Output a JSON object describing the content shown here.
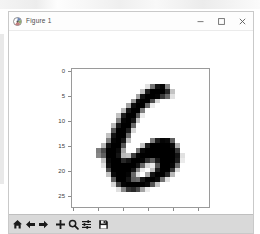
{
  "window": {
    "title": "Figure 1",
    "icon": "matplotlib-logo-icon",
    "controls": {
      "minimize": "minimize-button",
      "maximize": "maximize-button",
      "close": "close-button"
    }
  },
  "toolbar": {
    "buttons": [
      {
        "name": "home-button",
        "icon": "home-icon",
        "tooltip": "Reset original view"
      },
      {
        "name": "back-button",
        "icon": "arrow-left-icon",
        "tooltip": "Back to previous view"
      },
      {
        "name": "forward-button",
        "icon": "arrow-right-icon",
        "tooltip": "Forward to next view"
      },
      {
        "name": "pan-button",
        "icon": "move-cross-icon",
        "tooltip": "Pan axes with left mouse, zoom with right"
      },
      {
        "name": "zoom-button",
        "icon": "magnifier-icon",
        "tooltip": "Zoom to rectangle"
      },
      {
        "name": "subplots-button",
        "icon": "sliders-icon",
        "tooltip": "Configure subplots"
      },
      {
        "name": "save-button",
        "icon": "floppy-disk-icon",
        "tooltip": "Save the figure"
      }
    ]
  },
  "chart_data": {
    "type": "heatmap",
    "title": "",
    "xlabel": "",
    "ylabel": "",
    "colormap": "gray_r",
    "grid": false,
    "legend": "none",
    "xlim": [
      -0.5,
      27.5
    ],
    "ylim": [
      27.5,
      -0.5
    ],
    "xticks": [
      0,
      5,
      10,
      15,
      20,
      25
    ],
    "yticks": [
      0,
      5,
      10,
      15,
      20,
      25
    ],
    "xticklabels": [
      "0",
      "5",
      "10",
      "15",
      "20",
      "25"
    ],
    "yticklabels": [
      "0",
      "5",
      "10",
      "15",
      "20",
      "25"
    ],
    "shape": [
      28,
      28
    ],
    "vmin": 0,
    "vmax": 255,
    "values": [
      [
        0,
        0,
        0,
        0,
        0,
        0,
        0,
        0,
        0,
        0,
        0,
        0,
        0,
        0,
        0,
        0,
        0,
        0,
        0,
        0,
        0,
        0,
        0,
        0,
        0,
        0,
        0,
        0
      ],
      [
        0,
        0,
        0,
        0,
        0,
        0,
        0,
        0,
        0,
        0,
        0,
        0,
        0,
        0,
        0,
        0,
        0,
        0,
        0,
        0,
        0,
        0,
        0,
        0,
        0,
        0,
        0,
        0
      ],
      [
        0,
        0,
        0,
        0,
        0,
        0,
        0,
        0,
        0,
        0,
        0,
        0,
        0,
        0,
        0,
        0,
        0,
        0,
        0,
        0,
        0,
        0,
        0,
        0,
        0,
        0,
        0,
        0
      ],
      [
        0,
        0,
        0,
        0,
        0,
        0,
        0,
        0,
        0,
        0,
        0,
        0,
        0,
        0,
        0,
        30,
        140,
        235,
        250,
        120,
        0,
        0,
        0,
        0,
        0,
        0,
        0,
        0
      ],
      [
        0,
        0,
        0,
        0,
        0,
        0,
        0,
        0,
        0,
        0,
        0,
        0,
        0,
        0,
        60,
        225,
        255,
        255,
        255,
        215,
        60,
        0,
        0,
        0,
        0,
        0,
        0,
        0
      ],
      [
        0,
        0,
        0,
        0,
        0,
        0,
        0,
        0,
        0,
        0,
        0,
        0,
        0,
        90,
        235,
        255,
        255,
        250,
        200,
        150,
        30,
        0,
        0,
        0,
        0,
        0,
        0,
        0
      ],
      [
        0,
        0,
        0,
        0,
        0,
        0,
        0,
        0,
        0,
        0,
        0,
        0,
        105,
        245,
        255,
        255,
        180,
        40,
        0,
        0,
        0,
        0,
        0,
        0,
        0,
        0,
        0,
        0
      ],
      [
        0,
        0,
        0,
        0,
        0,
        0,
        0,
        0,
        0,
        0,
        0,
        90,
        240,
        255,
        255,
        150,
        20,
        0,
        0,
        0,
        0,
        0,
        0,
        0,
        0,
        0,
        0,
        0
      ],
      [
        0,
        0,
        0,
        0,
        0,
        0,
        0,
        0,
        0,
        0,
        70,
        235,
        255,
        255,
        130,
        0,
        0,
        0,
        0,
        0,
        0,
        0,
        0,
        0,
        0,
        0,
        0,
        0
      ],
      [
        0,
        0,
        0,
        0,
        0,
        0,
        0,
        0,
        0,
        60,
        225,
        255,
        255,
        170,
        20,
        0,
        0,
        0,
        0,
        0,
        0,
        0,
        0,
        0,
        0,
        0,
        0,
        0
      ],
      [
        0,
        0,
        0,
        0,
        0,
        0,
        0,
        0,
        0,
        130,
        250,
        255,
        235,
        60,
        0,
        0,
        0,
        0,
        0,
        0,
        0,
        0,
        0,
        0,
        0,
        0,
        0,
        0
      ],
      [
        0,
        0,
        0,
        0,
        0,
        0,
        0,
        0,
        70,
        230,
        255,
        255,
        150,
        0,
        0,
        0,
        0,
        0,
        0,
        0,
        0,
        0,
        0,
        0,
        0,
        0,
        0,
        0
      ],
      [
        0,
        0,
        0,
        0,
        0,
        0,
        0,
        0,
        170,
        255,
        255,
        225,
        40,
        0,
        0,
        0,
        0,
        0,
        0,
        0,
        0,
        0,
        0,
        0,
        0,
        0,
        0,
        0
      ],
      [
        0,
        0,
        0,
        0,
        0,
        0,
        0,
        60,
        235,
        255,
        255,
        150,
        0,
        0,
        0,
        0,
        0,
        0,
        0,
        0,
        0,
        0,
        0,
        0,
        0,
        0,
        0,
        0
      ],
      [
        0,
        0,
        0,
        0,
        0,
        0,
        0,
        130,
        250,
        255,
        235,
        60,
        0,
        0,
        0,
        0,
        130,
        225,
        250,
        245,
        160,
        0,
        0,
        0,
        0,
        0,
        0,
        0
      ],
      [
        0,
        0,
        0,
        0,
        0,
        0,
        70,
        235,
        255,
        255,
        170,
        0,
        0,
        0,
        60,
        225,
        255,
        255,
        255,
        255,
        245,
        80,
        0,
        0,
        0,
        0,
        0,
        0
      ],
      [
        0,
        0,
        0,
        0,
        0,
        130,
        180,
        255,
        255,
        245,
        90,
        0,
        0,
        140,
        245,
        255,
        255,
        255,
        255,
        255,
        255,
        200,
        0,
        0,
        0,
        0,
        0,
        0
      ],
      [
        0,
        0,
        0,
        0,
        0,
        120,
        160,
        255,
        255,
        235,
        70,
        60,
        190,
        250,
        255,
        255,
        255,
        255,
        255,
        255,
        255,
        235,
        30,
        0,
        0,
        0,
        0,
        0
      ],
      [
        0,
        0,
        0,
        0,
        0,
        0,
        60,
        245,
        255,
        255,
        215,
        235,
        255,
        255,
        250,
        200,
        160,
        230,
        255,
        255,
        255,
        225,
        20,
        0,
        0,
        0,
        0,
        0
      ],
      [
        0,
        0,
        0,
        0,
        0,
        0,
        30,
        235,
        255,
        255,
        255,
        255,
        255,
        235,
        150,
        40,
        20,
        170,
        255,
        255,
        250,
        150,
        0,
        0,
        0,
        0,
        0,
        0
      ],
      [
        0,
        0,
        0,
        0,
        0,
        0,
        0,
        180,
        255,
        255,
        255,
        255,
        235,
        120,
        20,
        0,
        60,
        225,
        255,
        255,
        200,
        40,
        0,
        0,
        0,
        0,
        0,
        0
      ],
      [
        0,
        0,
        0,
        0,
        0,
        0,
        0,
        60,
        245,
        255,
        255,
        250,
        150,
        30,
        0,
        90,
        235,
        255,
        255,
        215,
        70,
        0,
        0,
        0,
        0,
        0,
        0,
        0
      ],
      [
        0,
        0,
        0,
        0,
        0,
        0,
        0,
        0,
        160,
        255,
        255,
        235,
        160,
        150,
        230,
        255,
        255,
        245,
        140,
        30,
        0,
        0,
        0,
        0,
        0,
        0,
        0,
        0
      ],
      [
        0,
        0,
        0,
        0,
        0,
        0,
        0,
        0,
        40,
        190,
        250,
        255,
        255,
        255,
        255,
        245,
        170,
        60,
        0,
        0,
        0,
        0,
        0,
        0,
        0,
        0,
        0,
        0
      ],
      [
        0,
        0,
        0,
        0,
        0,
        0,
        0,
        0,
        0,
        30,
        120,
        200,
        215,
        180,
        90,
        20,
        0,
        0,
        0,
        0,
        0,
        0,
        0,
        0,
        0,
        0,
        0,
        0
      ],
      [
        0,
        0,
        0,
        0,
        0,
        0,
        0,
        0,
        0,
        0,
        0,
        0,
        0,
        0,
        0,
        0,
        0,
        0,
        0,
        0,
        0,
        0,
        0,
        0,
        0,
        0,
        0,
        0
      ],
      [
        0,
        0,
        0,
        0,
        0,
        0,
        0,
        0,
        0,
        0,
        0,
        0,
        0,
        0,
        0,
        0,
        0,
        0,
        0,
        0,
        0,
        0,
        0,
        0,
        0,
        0,
        0,
        0
      ],
      [
        0,
        0,
        0,
        0,
        0,
        0,
        0,
        0,
        0,
        0,
        0,
        0,
        0,
        0,
        0,
        0,
        0,
        0,
        0,
        0,
        0,
        0,
        0,
        0,
        0,
        0,
        0,
        0
      ]
    ]
  }
}
